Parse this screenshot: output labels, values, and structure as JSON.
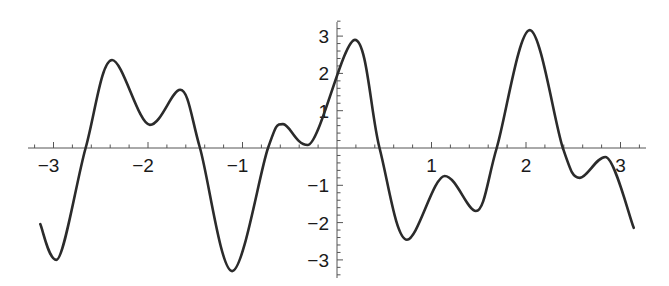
{
  "chart_data": {
    "type": "line",
    "title": "",
    "xlabel": "",
    "ylabel": "",
    "xlim": [
      -3.14,
      3.14
    ],
    "ylim": [
      -3.4,
      3.4
    ],
    "grid": false,
    "legend": null,
    "x_ticks": [
      -3,
      -2,
      -1,
      1,
      2,
      3
    ],
    "y_ticks": [
      -3,
      -2,
      -1,
      1,
      2,
      3
    ],
    "x_tick_labels": [
      "−3",
      "−2",
      "−1",
      "1",
      "2",
      "3"
    ],
    "y_tick_labels": [
      "−3",
      "−2",
      "−1",
      "1",
      "2",
      "3"
    ],
    "series": [
      {
        "name": "f(x)",
        "color": "#2b2b2b",
        "x": [
          -3.14,
          -2.97,
          -2.66,
          -2.38,
          -1.98,
          -1.66,
          -1.45,
          -1.11,
          -0.73,
          -0.57,
          -0.31,
          0.19,
          0.45,
          0.74,
          1.14,
          1.47,
          1.69,
          2.04,
          2.39,
          2.57,
          2.84,
          3.14
        ],
        "y": [
          -2.04,
          -3.0,
          0.0,
          2.36,
          0.62,
          1.56,
          0.0,
          -3.3,
          0.0,
          0.64,
          0.08,
          2.9,
          0.0,
          -2.46,
          -0.75,
          -1.69,
          0.0,
          3.16,
          0.0,
          -0.8,
          -0.24,
          -2.14
        ]
      }
    ]
  },
  "axes": {
    "color": "#555555"
  }
}
